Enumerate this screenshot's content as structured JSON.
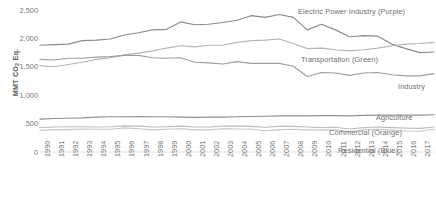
{
  "chart_data": {
    "type": "line",
    "title": "",
    "xlabel": "",
    "ylabel": "MMT CO2 Eq.",
    "ylabel_parts": {
      "prefix": "MMT CO",
      "sub": "2",
      "suffix": " Eq."
    },
    "ylim": [
      0,
      2500
    ],
    "yticks": [
      0,
      500,
      1000,
      1500,
      2000,
      2500
    ],
    "ytick_labels": [
      "0",
      "500",
      "1,000",
      "1,500",
      "2,000",
      "2,500"
    ],
    "grid": false,
    "legend": "inline-annotations",
    "x": [
      1990,
      1991,
      1992,
      1993,
      1994,
      1995,
      1996,
      1997,
      1998,
      1999,
      2000,
      2001,
      2002,
      2003,
      2004,
      2005,
      2006,
      2007,
      2008,
      2009,
      2010,
      2011,
      2012,
      2013,
      2014,
      2015,
      2016,
      2017,
      2018
    ],
    "xtick_labels": [
      "1990",
      "1991",
      "1992",
      "1993",
      "1994",
      "1995",
      "1996",
      "1997",
      "1998",
      "1999",
      "2000",
      "2001",
      "2002",
      "2003",
      "2004",
      "2005",
      "2006",
      "2007",
      "2008",
      "2009",
      "2010",
      "2011",
      "2012",
      "2013",
      "2014",
      "2015",
      "2016",
      "2017",
      "2018"
    ],
    "series": [
      {
        "name": "Electric Power Industry",
        "color_name": "Purple",
        "color": "#8a8a8a",
        "label": "Electric Power Industry (Purple)",
        "values": [
          1880,
          1890,
          1900,
          1960,
          1970,
          1990,
          2060,
          2100,
          2150,
          2160,
          2290,
          2240,
          2250,
          2280,
          2320,
          2400,
          2370,
          2420,
          2370,
          2150,
          2250,
          2150,
          2030,
          2050,
          2040,
          1900,
          1820,
          1750,
          1760
        ]
      },
      {
        "name": "Transportation",
        "color_name": "Green",
        "color": "#b4b4b4",
        "label": "Transportation (Green)",
        "values": [
          1520,
          1500,
          1540,
          1580,
          1630,
          1660,
          1710,
          1740,
          1780,
          1830,
          1870,
          1850,
          1880,
          1880,
          1930,
          1960,
          1970,
          1990,
          1910,
          1820,
          1830,
          1800,
          1780,
          1800,
          1830,
          1870,
          1900,
          1910,
          1930
        ]
      },
      {
        "name": "Industry",
        "color_name": "",
        "color": "#9d9d9d",
        "label": "Industry",
        "values": [
          1630,
          1620,
          1650,
          1650,
          1670,
          1680,
          1700,
          1700,
          1660,
          1650,
          1660,
          1580,
          1570,
          1550,
          1590,
          1560,
          1560,
          1560,
          1510,
          1330,
          1400,
          1390,
          1350,
          1390,
          1400,
          1360,
          1340,
          1340,
          1380
        ]
      },
      {
        "name": "Agriculture",
        "color_name": "",
        "color": "#8f8f8f",
        "label": "Agriculture",
        "values": [
          580,
          590,
          595,
          600,
          615,
          620,
          620,
          625,
          620,
          620,
          615,
          610,
          615,
          615,
          620,
          625,
          630,
          635,
          635,
          635,
          640,
          640,
          635,
          645,
          650,
          650,
          650,
          650,
          655
        ]
      },
      {
        "name": "Commercial",
        "color_name": "Orange",
        "color": "#bdbdbd",
        "label": "Commercial (Orange)",
        "values": [
          430,
          440,
          445,
          445,
          440,
          445,
          460,
          455,
          440,
          445,
          455,
          440,
          440,
          455,
          455,
          450,
          435,
          450,
          450,
          440,
          430,
          435,
          405,
          430,
          440,
          430,
          420,
          415,
          440
        ]
      },
      {
        "name": "Residential",
        "color_name": "Blue",
        "color": "#c6c6c6",
        "label": "Residential (Blue)",
        "values": [
          380,
          395,
          395,
          405,
          400,
          400,
          425,
          410,
          390,
          400,
          410,
          390,
          390,
          410,
          405,
          400,
          375,
          395,
          400,
          390,
          385,
          390,
          355,
          390,
          400,
          385,
          370,
          365,
          400
        ]
      }
    ]
  }
}
